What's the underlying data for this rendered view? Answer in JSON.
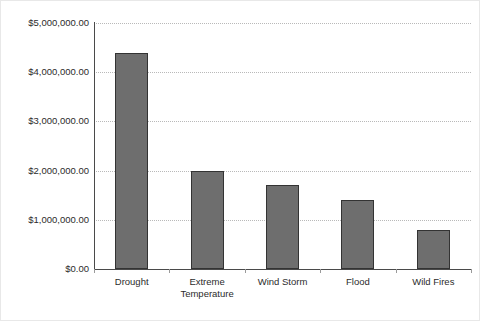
{
  "chart_data": {
    "type": "bar",
    "title": "",
    "subtitle": "",
    "xlabel": "",
    "ylabel": "",
    "categories": [
      "Drought",
      "Extreme\nTemperature",
      "Wind Storm",
      "Flood",
      "Wild Fires"
    ],
    "values": [
      4400000,
      2000000,
      1700000,
      1400000,
      800000
    ],
    "value_labels": [
      "$4,400,000.00",
      "$2,000,000.00",
      "$1,700,000.00",
      "$1,400,000.00",
      "$800,000.00"
    ],
    "ylim": [
      0,
      5000000
    ],
    "ytick_values": [
      0,
      1000000,
      2000000,
      3000000,
      4000000,
      5000000
    ],
    "ytick_labels": [
      "$0.00",
      "$1,000,000.00",
      "$2,000,000.00",
      "$3,000,000.00",
      "$4,000,000.00",
      "$5,000,000.00"
    ],
    "grid": true,
    "grid_style": "dotted",
    "grid_axis": "y",
    "legend": false,
    "legend_position": "none",
    "bar_color": "#6e6e6e",
    "bar_edge_color": "#333333",
    "grid_color": "#b9b9b9",
    "axis_color": "#4a4a4a",
    "text_color": "#2b2b2b",
    "background": "#ffffff",
    "annotations": []
  }
}
